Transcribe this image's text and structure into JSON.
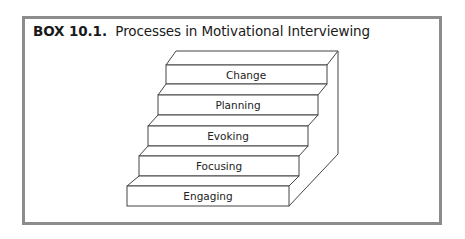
{
  "box": {
    "label": "BOX 10.1.",
    "title": "Processes in Motivational Interviewing",
    "border_color": "#8c8c8c"
  },
  "diagram": {
    "type": "staircase",
    "steps": [
      {
        "order": 1,
        "label": "Engaging"
      },
      {
        "order": 2,
        "label": "Focusing"
      },
      {
        "order": 3,
        "label": "Evoking"
      },
      {
        "order": 4,
        "label": "Planning"
      },
      {
        "order": 5,
        "label": "Change"
      }
    ]
  }
}
